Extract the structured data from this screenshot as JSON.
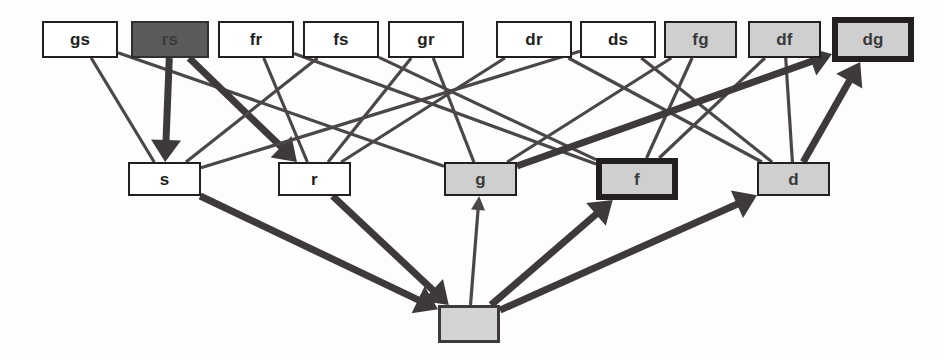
{
  "diagram": {
    "canvas": {
      "width": 944,
      "height": 360,
      "background": "#fdfdfd"
    },
    "colors": {
      "ink": "#231f20",
      "edge_thin": "#4a4746",
      "edge_thick": "#3d3a39",
      "fill_white": "#ffffff",
      "fill_gray": "#cfcfcf",
      "fill_dark": "#5b5b5b",
      "fill_gray_blank": "#d4d4d4"
    },
    "rows": {
      "top_label": "pair nodes",
      "middle_label": "single nodes",
      "bottom_label": "root node"
    },
    "nodes": [
      {
        "id": "gs",
        "label": "gs",
        "row": "top",
        "style": "plain",
        "x": 42,
        "y": 21,
        "w": 76,
        "h": 37
      },
      {
        "id": "rs",
        "label": "rs",
        "row": "top",
        "style": "dark",
        "x": 131,
        "y": 21,
        "w": 78,
        "h": 37
      },
      {
        "id": "fr",
        "label": "fr",
        "row": "top",
        "style": "plain",
        "x": 218,
        "y": 21,
        "w": 76,
        "h": 37
      },
      {
        "id": "fs",
        "label": "fs",
        "row": "top",
        "style": "plain",
        "x": 303,
        "y": 21,
        "w": 76,
        "h": 37
      },
      {
        "id": "gr",
        "label": "gr",
        "row": "top",
        "style": "plain",
        "x": 388,
        "y": 21,
        "w": 76,
        "h": 37
      },
      {
        "id": "dr",
        "label": "dr",
        "row": "top",
        "style": "plain",
        "x": 496,
        "y": 21,
        "w": 76,
        "h": 37
      },
      {
        "id": "ds",
        "label": "ds",
        "row": "top",
        "style": "plain",
        "x": 580,
        "y": 21,
        "w": 76,
        "h": 37
      },
      {
        "id": "fg",
        "label": "fg",
        "row": "top",
        "style": "gray",
        "x": 664,
        "y": 21,
        "w": 73,
        "h": 37
      },
      {
        "id": "df",
        "label": "df",
        "row": "top",
        "style": "gray",
        "x": 748,
        "y": 21,
        "w": 73,
        "h": 37
      },
      {
        "id": "dg",
        "label": "dg",
        "row": "top",
        "style": "gray-bold",
        "x": 832,
        "y": 17,
        "w": 82,
        "h": 45
      },
      {
        "id": "s",
        "label": "s",
        "row": "middle",
        "style": "plain",
        "x": 128,
        "y": 162,
        "w": 73,
        "h": 34
      },
      {
        "id": "r",
        "label": "r",
        "row": "middle",
        "style": "plain",
        "x": 278,
        "y": 162,
        "w": 73,
        "h": 34
      },
      {
        "id": "g",
        "label": "g",
        "row": "middle",
        "style": "gray",
        "x": 444,
        "y": 162,
        "w": 73,
        "h": 34
      },
      {
        "id": "f",
        "label": "f",
        "row": "middle",
        "style": "gray-bold",
        "x": 596,
        "y": 158,
        "w": 82,
        "h": 42
      },
      {
        "id": "d",
        "label": "d",
        "row": "middle",
        "style": "gray",
        "x": 757,
        "y": 162,
        "w": 73,
        "h": 34
      },
      {
        "id": "root",
        "label": "",
        "row": "bottom",
        "style": "gray-blank",
        "x": 438,
        "y": 305,
        "w": 62,
        "h": 38
      }
    ],
    "edges": [
      {
        "from": "gs",
        "to": "s",
        "weight": "thin",
        "arrow": false
      },
      {
        "from": "gs",
        "to": "g",
        "weight": "thin",
        "arrow": false
      },
      {
        "from": "rs",
        "to": "s",
        "weight": "thick",
        "arrow": true
      },
      {
        "from": "rs",
        "to": "r",
        "weight": "thick",
        "arrow": true
      },
      {
        "from": "fr",
        "to": "r",
        "weight": "thin",
        "arrow": false
      },
      {
        "from": "fr",
        "to": "f",
        "weight": "thin",
        "arrow": false
      },
      {
        "from": "fs",
        "to": "s",
        "weight": "thin",
        "arrow": false
      },
      {
        "from": "fs",
        "to": "f",
        "weight": "thin",
        "arrow": false
      },
      {
        "from": "gr",
        "to": "r",
        "weight": "thin",
        "arrow": false
      },
      {
        "from": "gr",
        "to": "g",
        "weight": "thin",
        "arrow": false
      },
      {
        "from": "dr",
        "to": "r",
        "weight": "thin",
        "arrow": false
      },
      {
        "from": "dr",
        "to": "d",
        "weight": "thin",
        "arrow": false
      },
      {
        "from": "ds",
        "to": "s",
        "weight": "thin",
        "arrow": false
      },
      {
        "from": "ds",
        "to": "d",
        "weight": "thin",
        "arrow": false
      },
      {
        "from": "fg",
        "to": "f",
        "weight": "thin",
        "arrow": false
      },
      {
        "from": "fg",
        "to": "g",
        "weight": "thin",
        "arrow": false
      },
      {
        "from": "df",
        "to": "d",
        "weight": "thin",
        "arrow": false
      },
      {
        "from": "df",
        "to": "f",
        "weight": "thin",
        "arrow": false
      },
      {
        "from": "g",
        "to": "dg",
        "weight": "thick",
        "arrow": true
      },
      {
        "from": "d",
        "to": "dg",
        "weight": "thick",
        "arrow": true
      },
      {
        "from": "s",
        "to": "root",
        "weight": "thick",
        "arrow": true
      },
      {
        "from": "r",
        "to": "root",
        "weight": "thick",
        "arrow": true
      },
      {
        "from": "root",
        "to": "g",
        "weight": "thin",
        "arrow": true
      },
      {
        "from": "root",
        "to": "f",
        "weight": "thick",
        "arrow": true
      },
      {
        "from": "root",
        "to": "d",
        "weight": "thick",
        "arrow": true
      }
    ]
  }
}
